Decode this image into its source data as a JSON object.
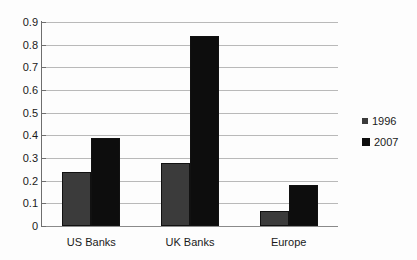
{
  "chart_data": {
    "type": "bar",
    "title": "",
    "subtitle": "",
    "xlabel": "",
    "ylabel": "",
    "categories": [
      "US Banks",
      "UK Banks",
      "Europe"
    ],
    "series": [
      {
        "name": "1996",
        "color": "#3b3b3b",
        "values": [
          0.24,
          0.28,
          0.065
        ]
      },
      {
        "name": "2007",
        "color": "#0d0d0d",
        "values": [
          0.39,
          0.84,
          0.18
        ]
      }
    ],
    "ylim": [
      0,
      0.9
    ],
    "y_ticks": [
      "0",
      "0.1",
      "0.2",
      "0.3",
      "0.4",
      "0.5",
      "0.6",
      "0.7",
      "0.8",
      "0.9"
    ],
    "y_tick_values": [
      0,
      0.1,
      0.2,
      0.3,
      0.4,
      0.5,
      0.6,
      0.7,
      0.8,
      0.9
    ],
    "grid": true,
    "legend_position": "right",
    "legend": [
      {
        "label": "1996",
        "swatch": "#3b3b3b"
      },
      {
        "label": "2007",
        "swatch": "#0d0d0d"
      }
    ]
  },
  "colors": {
    "background": "#fdfdfd",
    "gridline": "#b9b9b9",
    "axis": "#6e6e6e",
    "text": "#1a1a1a",
    "series_1996": "#3b3b3b",
    "series_2007": "#0d0d0d"
  }
}
